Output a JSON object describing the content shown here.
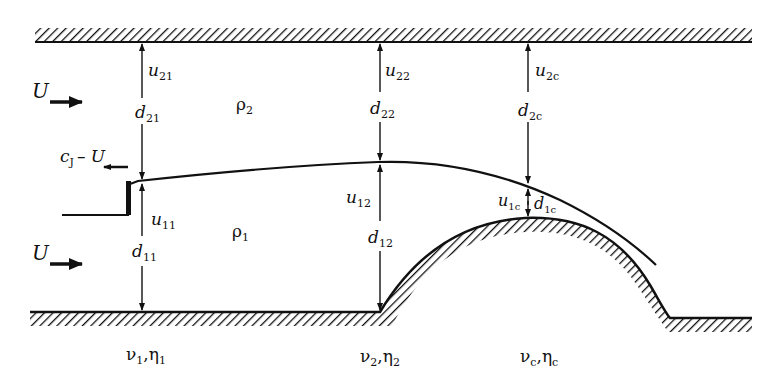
{
  "diagram": {
    "flow_labels": {
      "upper_inflow": "U",
      "lower_inflow": "U",
      "jump_speed": "c",
      "jump_speed_sub": "J",
      "jump_speed_suffix": "– U"
    },
    "densities": {
      "upper": "ρ",
      "upper_sub": "2",
      "lower": "ρ",
      "lower_sub": "1"
    },
    "stations": [
      {
        "id": "1",
        "upper_velocity": "u",
        "upper_velocity_sub": "21",
        "upper_depth": "d",
        "upper_depth_sub": "21",
        "lower_velocity": "u",
        "lower_velocity_sub": "11",
        "lower_depth": "d",
        "lower_depth_sub": "11",
        "params": "ν",
        "params_sub1": "1",
        "params_sep": ",η",
        "params_sub2": "1"
      },
      {
        "id": "2",
        "upper_velocity": "u",
        "upper_velocity_sub": "22",
        "upper_depth": "d",
        "upper_depth_sub": "22",
        "lower_velocity": "u",
        "lower_velocity_sub": "12",
        "lower_depth": "d",
        "lower_depth_sub": "12",
        "params": "ν",
        "params_sub1": "2",
        "params_sep": ",η",
        "params_sub2": "2"
      },
      {
        "id": "c",
        "upper_velocity": "u",
        "upper_velocity_sub": "2c",
        "upper_depth": "d",
        "upper_depth_sub": "2c",
        "lower_velocity": "u",
        "lower_velocity_sub": "1c",
        "lower_depth": "d",
        "lower_depth_sub": "1c",
        "params": "ν",
        "params_sub1": "c",
        "params_sep": ",η",
        "params_sub2": "c"
      }
    ],
    "colors": {
      "ink": "#111111",
      "background": "#ffffff"
    }
  }
}
